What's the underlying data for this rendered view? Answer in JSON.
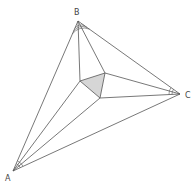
{
  "colors": {
    "line": "#555555",
    "fill": "#d6d6d6",
    "label": "#444444"
  },
  "vertices": {
    "A": {
      "label": "A",
      "x": 13,
      "y": 171,
      "lx": 5,
      "ly": 181
    },
    "B": {
      "label": "B",
      "x": 78,
      "y": 21,
      "lx": 74,
      "ly": 15
    },
    "C": {
      "label": "C",
      "x": 180,
      "y": 94,
      "lx": 185,
      "ly": 98
    }
  },
  "inner_triangle": {
    "P": {
      "x": 80,
      "y": 81
    },
    "Q": {
      "x": 105,
      "y": 73
    },
    "R": {
      "x": 100,
      "y": 98
    }
  }
}
